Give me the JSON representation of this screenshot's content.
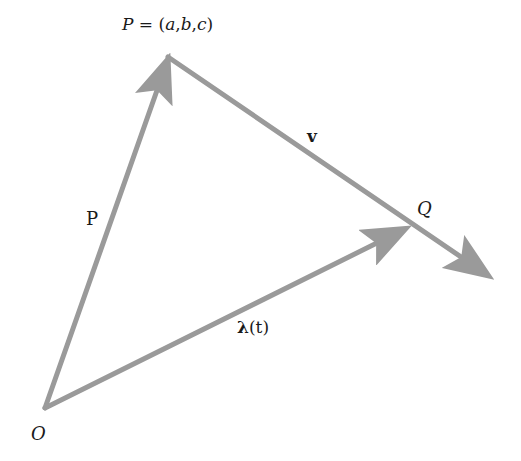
{
  "diagram": {
    "type": "vector-line-diagram",
    "stroke_color": "#9a9a9a",
    "text_color": "#1a1a1a",
    "points": {
      "O": {
        "label": "O",
        "x": 45,
        "y": 408
      },
      "P": {
        "label": "P = (a,b,c)",
        "x": 168,
        "y": 57
      },
      "Q": {
        "label": "Q",
        "x": 408,
        "y": 228
      }
    },
    "vectors": [
      {
        "name": "P",
        "label": "P",
        "from": "O",
        "to": "P"
      },
      {
        "name": "lambda",
        "label": "λ(t)",
        "from": "O",
        "to": "Q"
      },
      {
        "name": "v",
        "label": "v",
        "from": "P",
        "through": "Q",
        "tip_x": 493,
        "tip_y": 278
      }
    ],
    "labels": {
      "p_point": "P = (a,b,c)",
      "q_point": "Q",
      "o_point": "O",
      "p_vector": "P",
      "v_vector": "v",
      "lambda_symbol": "λ",
      "lambda_arg": "(t)"
    }
  }
}
